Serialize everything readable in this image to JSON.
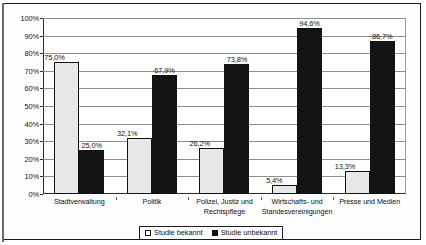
{
  "chart_data": {
    "type": "bar",
    "title": "",
    "subtitle": "",
    "xlabel": "",
    "ylabel": "",
    "ylim": [
      0,
      100
    ],
    "ytick_labels": [
      "100%",
      "90%",
      "80%",
      "70%",
      "60%",
      "50%",
      "40%",
      "30%",
      "20%",
      "10%",
      "0%"
    ],
    "ytick_values": [
      100,
      90,
      80,
      70,
      60,
      50,
      40,
      30,
      20,
      10,
      0
    ],
    "grid": true,
    "legend_position": "bottom",
    "categories": [
      "Stadtverwaltung",
      "Politik",
      "Polizei, Justiz und Rechtspflege",
      "Wirtschafts- und Standesvereinigungen",
      "Presse und Medien"
    ],
    "category_lines": [
      [
        "Stadtverwaltung"
      ],
      [
        "Politik"
      ],
      [
        "Polizei, Justiz und",
        "Rechtspflege"
      ],
      [
        "Wirtschafts- und",
        "Standesvereinigungen"
      ],
      [
        "Presse und Medien"
      ]
    ],
    "series": [
      {
        "name": "Studie bekannt",
        "color": "#e8e8e8",
        "values": [
          75.0,
          32.1,
          26.2,
          5.4,
          13.3
        ],
        "labels": [
          "75,0%",
          "32,1%",
          "26,2%",
          "5,4%",
          "13,3%"
        ]
      },
      {
        "name": "Studie unbekannt",
        "color": "#141414",
        "values": [
          25.0,
          67.9,
          73.8,
          94.6,
          86.7
        ],
        "labels": [
          "25,0%",
          "67,9%",
          "73,8%",
          "94,6%",
          "86,7%"
        ]
      }
    ]
  },
  "legend": {
    "items": [
      {
        "label": "Studie bekannt",
        "swatch": "light"
      },
      {
        "label": "Studie unbekannt",
        "swatch": "dark"
      }
    ]
  }
}
